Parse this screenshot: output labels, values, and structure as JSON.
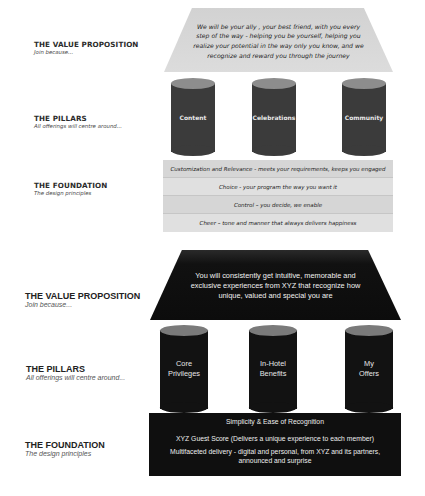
{
  "diagram_top": {
    "style": "light",
    "labels": {
      "value_proposition": {
        "title": "THE VALUE PROPOSITION",
        "subtitle": "Join because..."
      },
      "pillars": {
        "title": "THE PILLARS",
        "subtitle": "All offerings will centre around..."
      },
      "foundation": {
        "title": "THE FOUNDATION",
        "subtitle": "The design principles"
      }
    },
    "roof_text": "We will be your ally , your best friend, with you every step of the way -  helping you be yourself, helping you realize your potential in the way only you know, and we recognize and reward you through the journey",
    "pillars": [
      "Content",
      "Celebrations",
      "Community"
    ],
    "foundation_rows": [
      "Customization and Relevance -  meets your requirements, keeps you engaged",
      "Choice -  your program the way you want it",
      "Control – you decide, we enable",
      "Cheer – tone and manner that always delivers happiness"
    ],
    "colors": {
      "roof": "#d6d6d6",
      "pillar_body": "#3b3b3b",
      "pillar_top": "#8d8d8d",
      "foundation": "#dcdcdc"
    }
  },
  "diagram_bottom": {
    "style": "dark",
    "labels": {
      "value_proposition": {
        "title": "THE VALUE PROPOSITION",
        "subtitle": "Join because..."
      },
      "pillars": {
        "title": "THE PILLARS",
        "subtitle": "All offerings will centre around..."
      },
      "foundation": {
        "title": "THE FOUNDATION",
        "subtitle": "The design principles"
      }
    },
    "roof_text": "You will consistently get intuitive, memorable and exclusive experiences from XYZ that recognize how unique, valued and special you are",
    "pillars": [
      {
        "line1": "Core",
        "line2": "Privileges"
      },
      {
        "line1": "In-Hotel",
        "line2": "Benefits"
      },
      {
        "line1": "My",
        "line2": "Offers"
      }
    ],
    "foundation_rows": [
      "Simplicity & Ease of Recognition",
      "XYZ Guest Score (Delivers a unique experience to each member)",
      "Multifaceted delivery - digital and personal, from XYZ and its partners, announced and surprise"
    ],
    "colors": {
      "roof": "#111111",
      "pillar_body": "#121212",
      "pillar_top": "#7a7a7a",
      "foundation": "#0f0f0f"
    }
  }
}
